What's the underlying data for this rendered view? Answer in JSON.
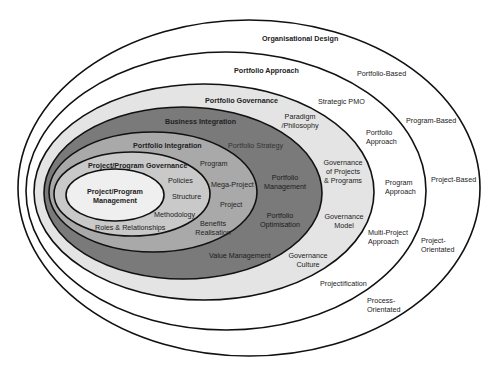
{
  "diagram": {
    "type": "nested-ellipses",
    "layers": [
      {
        "id": "organisational-design",
        "title": "Organisational Design",
        "fill": "#ffffff",
        "cx": 249,
        "cy": 188,
        "rx": 231,
        "ry": 168
      },
      {
        "id": "portfolio-approach",
        "title": "Portfolio Approach",
        "fill": "#ffffff",
        "cx": 226,
        "cy": 191,
        "rx": 200,
        "ry": 139
      },
      {
        "id": "portfolio-governance",
        "title": "Portfolio Governance",
        "fill": "#e4e4e4",
        "cx": 204,
        "cy": 192,
        "rx": 170,
        "ry": 108
      },
      {
        "id": "business-integration",
        "title": "Business Integration",
        "fill": "#7a7a7a",
        "cx": 183,
        "cy": 193,
        "rx": 139,
        "ry": 86
      },
      {
        "id": "portfolio-integration",
        "title": "Portfolio Integration",
        "fill": "#a9a9a9",
        "cx": 153,
        "cy": 192,
        "rx": 104,
        "ry": 60
      },
      {
        "id": "project-program-governance",
        "title": "Project/Program Governance",
        "fill": "#c9c9c9",
        "cx": 132,
        "cy": 194,
        "rx": 78,
        "ry": 42
      },
      {
        "id": "project-program-management",
        "title": "Project/Program Management",
        "fill": "#efefef",
        "cx": 115,
        "cy": 195,
        "rx": 49,
        "ry": 26
      }
    ],
    "labels": {
      "organisational_design": "Organisational Design",
      "portfolio_approach": "Portfolio Approach",
      "portfolio_governance": "Portfolio Governance",
      "business_integration": "Business Integration",
      "portfolio_integration": "Portfolio Integration",
      "project_program_governance": "Project/Program Governance",
      "project_program_management_1": "Project/Program",
      "project_program_management_2": "Management",
      "portfolio_based": "Portfolio-Based",
      "program_based": "Program-Based",
      "project_based": "Project-Based",
      "project_orientated_1": "Project-",
      "project_orientated_2": "Orientated",
      "process_orientated_1": "Process-",
      "process_orientated_2": "Orientated",
      "strategic_pmo": "Strategic PMO",
      "portfolio_approach_r_1": "Portfolio",
      "portfolio_approach_r_2": "Approach",
      "program_approach_1": "Program",
      "program_approach_2": "Approach",
      "multi_project_approach_1": "Multi-Project",
      "multi_project_approach_2": "Approach",
      "projectification": "Projectification",
      "paradigm_1": "Paradigm",
      "paradigm_2": "/Philosophy",
      "gov_projects_1": "Governance",
      "gov_projects_2": "of Projects",
      "gov_projects_3": "& Programs",
      "gov_model_1": "Governance",
      "gov_model_2": "Model",
      "gov_culture_1": "Governance",
      "gov_culture_2": "Culture",
      "portfolio_strategy": "Portfolio Strategy",
      "portfolio_management_1": "Portfolio",
      "portfolio_management_2": "Management",
      "portfolio_optimisation_1": "Portfolio",
      "portfolio_optimisation_2": "Optimisation",
      "value_management": "Value Management",
      "program": "Program",
      "mega_project": "Mega-Project",
      "project": "Project",
      "benefits_realisation_1": "Benefits",
      "benefits_realisation_2": "Realisation",
      "policies": "Policies",
      "structure": "Structure",
      "methodology": "Methodology",
      "roles_relationships": "Roles & Relationships"
    }
  }
}
